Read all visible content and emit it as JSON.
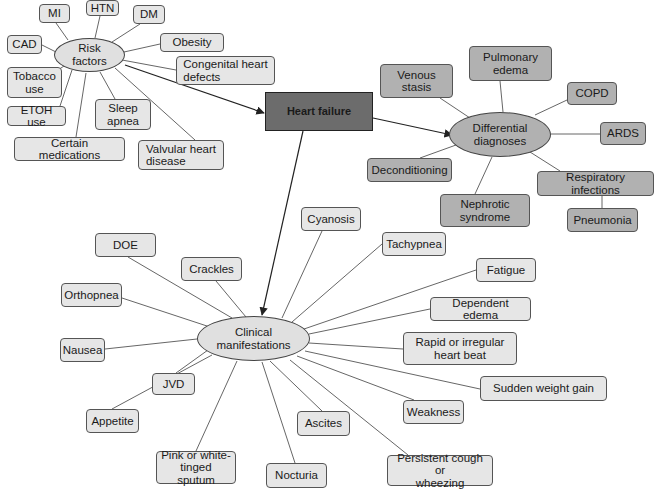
{
  "central": {
    "label": "Heart failure"
  },
  "hubs": {
    "risk": "Risk\nfactors",
    "diff": "Differential\ndiagnoses",
    "clin": "Clinical\nmanifestations"
  },
  "risk_factors": [
    "MI",
    "HTN",
    "DM",
    "CAD",
    "Obesity",
    "Congenital heart\ndefects",
    "Tobacco\nuse",
    "ETOH use",
    "Sleep\napnea",
    "Certain medications",
    "Valvular heart\ndisease"
  ],
  "differential_diagnoses": [
    "Venous\nstasis",
    "Pulmonary\nedema",
    "COPD",
    "ARDS",
    "Deconditioning",
    "Nephrotic\nsyndrome",
    "Respiratory infections",
    "Pneumonia"
  ],
  "clinical_manifestations": [
    "Cyanosis",
    "DOE",
    "Crackles",
    "Tachypnea",
    "Orthopnea",
    "Fatigue",
    "Dependent edema",
    "Nausea",
    "Rapid or irregular\nheart beat",
    "JVD",
    "Sudden weight gain",
    "Appetite",
    "Weakness",
    "Ascites",
    "Pink or white-\ntinged sputum",
    "Nocturia",
    "Persistent cough or\nwheezing"
  ],
  "colors": {
    "central": "#6c6c6c",
    "differential": "#b1b1b1",
    "clinical": "#e6e6e6",
    "risk": "#e6e6e6"
  }
}
